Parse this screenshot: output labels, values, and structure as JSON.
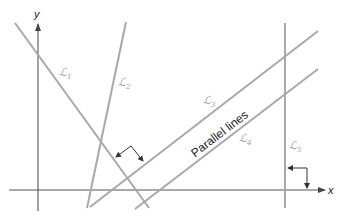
{
  "figure": {
    "colors": {
      "line": "#a8a8a8",
      "axis": "#555555",
      "label": "#a0a0a0",
      "marker": "#333333",
      "text": "#222222"
    },
    "axes": {
      "x_label": "x",
      "y_label": "y"
    },
    "lines": [
      {
        "id": "L1",
        "label": "ℒ",
        "sub": "1"
      },
      {
        "id": "L2",
        "label": "ℒ",
        "sub": "2"
      },
      {
        "id": "L3",
        "label": "ℒ",
        "sub": "3"
      },
      {
        "id": "L4",
        "label": "ℒ",
        "sub": "4"
      },
      {
        "id": "L5",
        "label": "ℒ",
        "sub": "5"
      }
    ],
    "annotation": "Parallel lines"
  }
}
